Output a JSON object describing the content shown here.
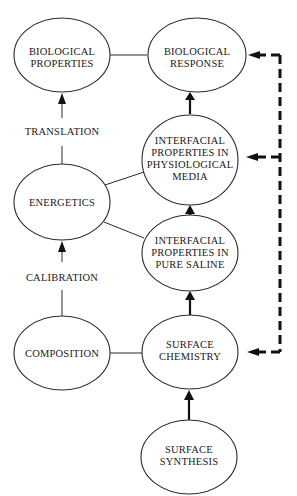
{
  "diagram": {
    "nodes": [
      {
        "id": "biological-properties",
        "lines": [
          "BIOLOGICAL",
          "PROPERTIES"
        ]
      },
      {
        "id": "biological-response",
        "lines": [
          "BIOLOGICAL",
          "RESPONSE"
        ]
      },
      {
        "id": "interfacial-physiological",
        "lines": [
          "INTERFACIAL",
          "PROPERTIES IN",
          "PHYSIOLOGICAL",
          "MEDIA"
        ]
      },
      {
        "id": "energetics",
        "lines": [
          "ENERGETICS"
        ]
      },
      {
        "id": "interfacial-saline",
        "lines": [
          "INTERFACIAL",
          "PROPERTIES IN",
          "PURE SALINE"
        ]
      },
      {
        "id": "composition",
        "lines": [
          "COMPOSITION"
        ]
      },
      {
        "id": "surface-chemistry",
        "lines": [
          "SURFACE",
          "CHEMISTRY"
        ]
      },
      {
        "id": "surface-synthesis",
        "lines": [
          "SURFACE",
          "SYNTHESIS"
        ]
      }
    ],
    "edge_labels": {
      "translation": "TRANSLATION",
      "calibration": "CALIBRATION"
    },
    "edges": [
      {
        "from": "biological-properties",
        "to": "biological-response",
        "type": "line"
      },
      {
        "from": "energetics",
        "to": "biological-properties",
        "type": "arrow",
        "label": "TRANSLATION"
      },
      {
        "from": "interfacial-physiological",
        "to": "biological-response",
        "type": "arrow"
      },
      {
        "from": "energetics",
        "to": "interfacial-physiological",
        "type": "line"
      },
      {
        "from": "energetics",
        "to": "interfacial-saline",
        "type": "line"
      },
      {
        "from": "interfacial-saline",
        "to": "interfacial-physiological",
        "type": "arrow"
      },
      {
        "from": "composition",
        "to": "energetics",
        "type": "arrow",
        "label": "CALIBRATION"
      },
      {
        "from": "composition",
        "to": "surface-chemistry",
        "type": "line"
      },
      {
        "from": "surface-chemistry",
        "to": "interfacial-saline",
        "type": "arrow"
      },
      {
        "from": "surface-synthesis",
        "to": "surface-chemistry",
        "type": "arrow"
      },
      {
        "from": "feedback-loop",
        "to": "biological-response",
        "type": "dashed-arrow"
      },
      {
        "from": "feedback-loop",
        "to": "interfacial-physiological",
        "type": "dashed-arrow"
      },
      {
        "from": "feedback-loop",
        "to": "surface-chemistry",
        "type": "dashed-arrow"
      }
    ]
  }
}
